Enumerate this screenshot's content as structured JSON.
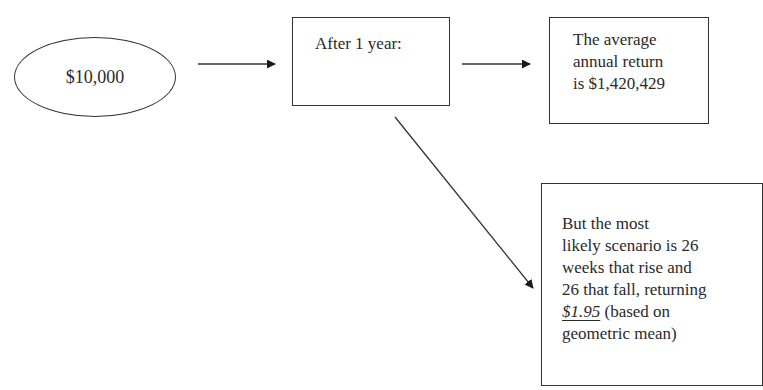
{
  "diagram": {
    "start_node": {
      "shape": "ellipse",
      "label": "$10,000"
    },
    "step_node": {
      "shape": "rectangle",
      "label": "After 1 year:"
    },
    "average_node": {
      "shape": "rectangle",
      "lines": [
        "The average",
        "annual return",
        "is $1,420,429"
      ]
    },
    "likely_node": {
      "shape": "rectangle",
      "lines": [
        "But the most",
        "likely scenario is 26",
        "weeks that rise and",
        "26 that fall, returning"
      ],
      "highlight_value": "$1.95",
      "after_highlight": " (based on",
      "last_line": "geometric mean)"
    },
    "edges": [
      {
        "from": "start_node",
        "to": "step_node",
        "direction": "right"
      },
      {
        "from": "step_node",
        "to": "average_node",
        "direction": "right"
      },
      {
        "from": "step_node",
        "to": "likely_node",
        "direction": "down-right"
      }
    ],
    "colors": {
      "stroke": "#333333",
      "text": "#2a2a2a",
      "background": "#ffffff"
    }
  }
}
